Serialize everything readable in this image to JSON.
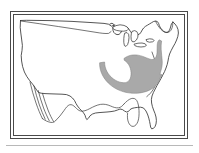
{
  "figure": {
    "kind": "map",
    "title": "Distribution map of the contiguous United States",
    "caption": "",
    "region_name": "United States (contiguous 48 states)",
    "projection_note": "",
    "width_px": 199,
    "height_px": 153
  },
  "frame": {
    "style": "double-rule rectangle",
    "outer_stroke": "#4a4a4a",
    "inner_stroke": "#4a4a4a",
    "outer_rect": {
      "x": 10,
      "y": 11,
      "width": 178,
      "height": 128
    },
    "inner_rect": {
      "x": 13,
      "y": 14,
      "width": 172,
      "height": 122
    }
  },
  "basemap": {
    "land_fill": "#ffffff",
    "coast_stroke": "#2b2b2b",
    "internal_stroke": "#3a3a3a",
    "features": [
      {
        "name": "canadian-border",
        "label": "Northern border"
      },
      {
        "name": "pacific-coast",
        "label": "Pacific coast"
      },
      {
        "name": "gulf-coast",
        "label": "Gulf of Mexico coast"
      },
      {
        "name": "atlantic-coast",
        "label": "Atlantic coast"
      },
      {
        "name": "florida-peninsula",
        "label": "Florida"
      },
      {
        "name": "great-lakes",
        "label": "Great Lakes"
      },
      {
        "name": "baja-california",
        "label": "Baja California"
      },
      {
        "name": "new-england",
        "label": "New England"
      }
    ]
  },
  "shaded_region": {
    "name": "distribution-range",
    "label": "Shaded distribution range",
    "fill_color": "#a9a9a9",
    "outline_color": "#7d7d7d",
    "approx_states": "Mid-Atlantic and Southeast: Virginia, North Carolina, South Carolina, Georgia, Tennessee, Kentucky, West Virginia, Alabama"
  },
  "legend": {
    "present": false,
    "entries": []
  },
  "annotations": {
    "labels": [],
    "scale_bar": null,
    "north_arrow": null
  },
  "colors": {
    "background": "#ffffff",
    "ink": "#2b2b2b",
    "shade": "#a9a9a9",
    "frame": "#4a4a4a",
    "bottom_rule": "#9a9a9a"
  }
}
